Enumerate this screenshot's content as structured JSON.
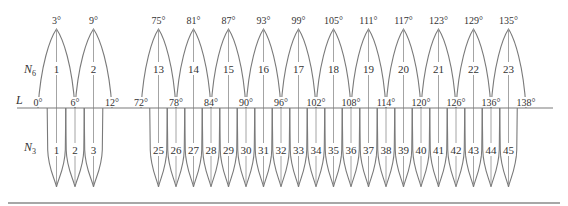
{
  "diagram": {
    "axis_label": "L",
    "upper_row_label": "N",
    "upper_row_subscript": "6",
    "lower_row_label": "N",
    "lower_row_subscript": "3",
    "colors": {
      "line": "#7a7a7a",
      "text": "#333333",
      "background": "#ffffff"
    },
    "upper_petals": [
      {
        "number": "1",
        "peak_label": "3°",
        "peak_deg": 3
      },
      {
        "number": "2",
        "peak_label": "9°",
        "peak_deg": 9
      },
      {
        "number": "13",
        "peak_label": "75°",
        "peak_deg": 75
      },
      {
        "number": "14",
        "peak_label": "81°",
        "peak_deg": 81
      },
      {
        "number": "15",
        "peak_label": "87°",
        "peak_deg": 87
      },
      {
        "number": "16",
        "peak_label": "93°",
        "peak_deg": 93
      },
      {
        "number": "17",
        "peak_label": "99°",
        "peak_deg": 99
      },
      {
        "number": "18",
        "peak_label": "105°",
        "peak_deg": 105
      },
      {
        "number": "19",
        "peak_label": "111°",
        "peak_deg": 111
      },
      {
        "number": "20",
        "peak_label": "117°",
        "peak_deg": 117
      },
      {
        "number": "21",
        "peak_label": "123°",
        "peak_deg": 123
      },
      {
        "number": "22",
        "peak_label": "129°",
        "peak_deg": 129
      },
      {
        "number": "23",
        "peak_label": "135°",
        "peak_deg": 135
      }
    ],
    "base_labels": [
      {
        "label": "0°",
        "deg": 0
      },
      {
        "label": "6°",
        "deg": 6
      },
      {
        "label": "12°",
        "deg": 12
      },
      {
        "label": "72°",
        "deg": 72
      },
      {
        "label": "78°",
        "deg": 78
      },
      {
        "label": "84°",
        "deg": 84
      },
      {
        "label": "90°",
        "deg": 90
      },
      {
        "label": "96°",
        "deg": 96
      },
      {
        "label": "102°",
        "deg": 102
      },
      {
        "label": "108°",
        "deg": 108
      },
      {
        "label": "114°",
        "deg": 114
      },
      {
        "label": "120°",
        "deg": 120
      },
      {
        "label": "126°",
        "deg": 126
      },
      {
        "label": "136°",
        "deg": 132
      },
      {
        "label": "138°",
        "deg": 138
      }
    ],
    "lower_petals": [
      {
        "number": "1",
        "deg": 3
      },
      {
        "number": "2",
        "deg": 6
      },
      {
        "number": "3",
        "deg": 9
      },
      {
        "number": "25",
        "deg": 75
      },
      {
        "number": "26",
        "deg": 78
      },
      {
        "number": "27",
        "deg": 81
      },
      {
        "number": "28",
        "deg": 84
      },
      {
        "number": "29",
        "deg": 87
      },
      {
        "number": "30",
        "deg": 90
      },
      {
        "number": "31",
        "deg": 93
      },
      {
        "number": "32",
        "deg": 96
      },
      {
        "number": "33",
        "deg": 99
      },
      {
        "number": "34",
        "deg": 102
      },
      {
        "number": "35",
        "deg": 105
      },
      {
        "number": "36",
        "deg": 108
      },
      {
        "number": "37",
        "deg": 111
      },
      {
        "number": "38",
        "deg": 114
      },
      {
        "number": "39",
        "deg": 117
      },
      {
        "number": "40",
        "deg": 120
      },
      {
        "number": "41",
        "deg": 123
      },
      {
        "number": "42",
        "deg": 126
      },
      {
        "number": "43",
        "deg": 129
      },
      {
        "number": "44",
        "deg": 132
      },
      {
        "number": "45",
        "deg": 135
      }
    ]
  }
}
